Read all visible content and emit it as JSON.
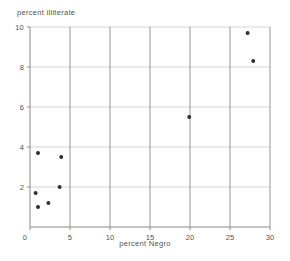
{
  "colors": {
    "background": "#ffffff",
    "grid_vertical": "#969696",
    "grid_horizontal": "#d4d4d4",
    "axis": "#8a8a8a",
    "tick": "#8a8a8a",
    "point": "#2f2f2f",
    "text": "#525252"
  },
  "chart_data": {
    "type": "scatter",
    "title": "",
    "xlabel": "percent Negro",
    "ylabel": "percent illiterate",
    "x_axis": {
      "label": "percent Negro",
      "range": [
        0,
        30
      ],
      "ticks": [
        0,
        5,
        10,
        15,
        20,
        25,
        30
      ],
      "gridlines": [
        5,
        10,
        15,
        20,
        25,
        30
      ]
    },
    "y_axis": {
      "label": "percent illiterate",
      "range": [
        0,
        10
      ],
      "ticks": [
        2,
        4,
        6,
        8,
        10
      ],
      "gridlines": [
        2,
        4,
        6,
        8,
        10
      ]
    },
    "grid": true,
    "legend": "none",
    "points": [
      [
        1.0,
        3.7
      ],
      [
        3.9,
        3.5
      ],
      [
        3.7,
        2.0
      ],
      [
        0.7,
        1.7
      ],
      [
        2.3,
        1.2
      ],
      [
        1.0,
        1.0
      ],
      [
        19.9,
        5.5
      ],
      [
        27.2,
        9.7
      ],
      [
        27.9,
        8.3
      ]
    ]
  }
}
